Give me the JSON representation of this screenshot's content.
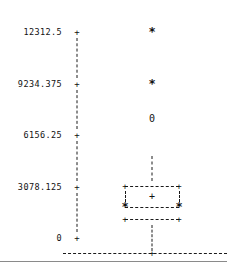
{
  "chart_data": {
    "type": "box",
    "title": "",
    "xlabel": "",
    "ylabel": "",
    "ylim": [
      0,
      13081
    ],
    "grid": false,
    "legend": null,
    "style": "character-cell / ASCII box plot",
    "y_axis": {
      "tick_labels": [
        "12312.5",
        "9234.375",
        "6156.25",
        "3078.125",
        "0"
      ],
      "tick_values": [
        12312.5,
        9234.375,
        6156.25,
        3078.125,
        0
      ],
      "tick_glyph": "+",
      "axis_glyph": "|",
      "tick_increment": 3078.125
    },
    "x_axis": {
      "axis_glyph": "-",
      "tick_glyph": "+",
      "categories": [
        ""
      ],
      "tick_count": 1
    },
    "series": [
      {
        "name": "",
        "box": {
          "lower_fence": 1150,
          "lower_quartile": 1850,
          "median": 2450,
          "upper_quartile": 3080,
          "upper_whisker_top": 4900,
          "lower_whisker_bottom": 170
        },
        "glyphs": {
          "corner": "+",
          "median": "+",
          "hinge": "*",
          "box_edge": "-",
          "box_side": "|",
          "whisker": "|"
        },
        "outliers": [
          {
            "value": 12312.5,
            "marker": "*",
            "type": "extreme"
          },
          {
            "value": 9234.375,
            "marker": "*",
            "type": "extreme"
          },
          {
            "value": 7100,
            "marker": "0",
            "type": "mild"
          }
        ]
      }
    ]
  }
}
